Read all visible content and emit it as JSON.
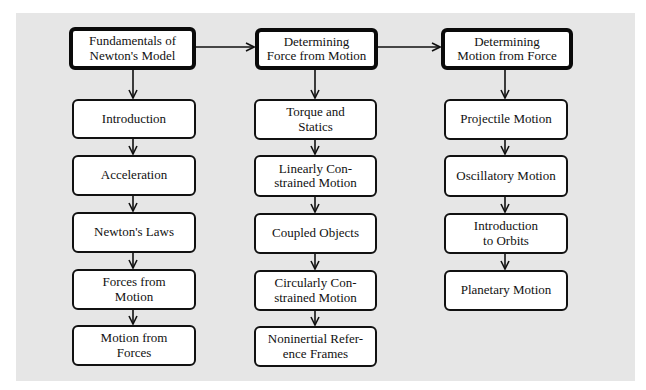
{
  "diagram": {
    "colors": {
      "panel_background": "#e6e6e6",
      "box_fill": "#ffffff",
      "stroke": "#111111"
    },
    "columns": [
      {
        "header": {
          "line1": "Fundamentals of",
          "line2": "Newton's Model"
        },
        "items": [
          {
            "line1": "Introduction",
            "line2": ""
          },
          {
            "line1": "Acceleration",
            "line2": ""
          },
          {
            "line1": "Newton's Laws",
            "line2": ""
          },
          {
            "line1": "Forces from",
            "line2": "Motion"
          },
          {
            "line1": "Motion from",
            "line2": "Forces"
          }
        ]
      },
      {
        "header": {
          "line1": "Determining",
          "line2": "Force from Motion"
        },
        "items": [
          {
            "line1": "Torque and",
            "line2": "Statics"
          },
          {
            "line1": "Linearly Con-",
            "line2": "strained Motion"
          },
          {
            "line1": "Coupled Objects",
            "line2": ""
          },
          {
            "line1": "Circularly Con-",
            "line2": "strained Motion"
          },
          {
            "line1": "Noninertial Refer-",
            "line2": "ence Frames"
          }
        ]
      },
      {
        "header": {
          "line1": "Determining",
          "line2": "Motion from Force"
        },
        "items": [
          {
            "line1": "Projectile Motion",
            "line2": ""
          },
          {
            "line1": "Oscillatory Motion",
            "line2": ""
          },
          {
            "line1": "Introduction",
            "line2": "to Orbits"
          },
          {
            "line1": "Planetary Motion",
            "line2": ""
          }
        ]
      }
    ],
    "edges": [
      {
        "from": "Fundamentals of Newton's Model",
        "to": "Determining Force from Motion"
      },
      {
        "from": "Determining Force from Motion",
        "to": "Determining Motion from Force"
      }
    ]
  }
}
